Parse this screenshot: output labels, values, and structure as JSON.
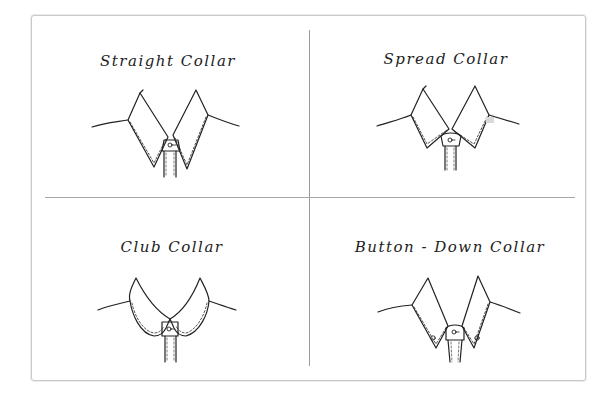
{
  "figure": {
    "panels": [
      {
        "id": "straight",
        "title": "Straight Collar",
        "icon": "straight-collar-drawing"
      },
      {
        "id": "spread",
        "title": "Spread Collar",
        "icon": "spread-collar-drawing"
      },
      {
        "id": "club",
        "title": "Club Collar",
        "icon": "club-collar-drawing"
      },
      {
        "id": "button-down",
        "title": "Button - Down Collar",
        "icon": "button-down-collar-drawing"
      }
    ],
    "colors": {
      "ink": "#222222",
      "frame": "#c9c9c9",
      "divider": "#9a9a9a",
      "background": "#ffffff"
    }
  }
}
